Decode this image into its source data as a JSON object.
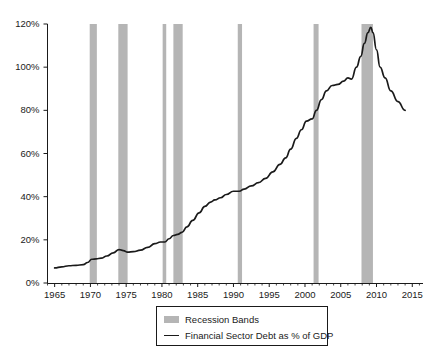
{
  "chart_data": {
    "type": "line",
    "title": "",
    "subtitle": "",
    "xlabel": "",
    "ylabel": "",
    "xlim": [
      1964,
      2016.5
    ],
    "ylim": [
      0,
      120
    ],
    "grid": false,
    "legend_position": "bottom-center",
    "x_tick_labels": [
      "1965",
      "1970",
      "1975",
      "1980",
      "1985",
      "1990",
      "1995",
      "2000",
      "2005",
      "2010",
      "2015"
    ],
    "x_tick_values": [
      1965,
      1970,
      1975,
      1980,
      1985,
      1990,
      1995,
      2000,
      2005,
      2010,
      2015
    ],
    "y_tick_labels": [
      "0%",
      "20%",
      "40%",
      "60%",
      "80%",
      "100%",
      "120%"
    ],
    "y_tick_values": [
      0,
      20,
      40,
      60,
      80,
      100,
      120
    ],
    "series": [
      {
        "name": "Financial Sector Debt as % of GDP",
        "type": "line",
        "color": "#1a1a1a",
        "x": [
          1965.0,
          1966.0,
          1967.0,
          1968.0,
          1969.0,
          1969.6,
          1970.2,
          1970.8,
          1971.5,
          1972.3,
          1973.2,
          1974.0,
          1974.6,
          1975.2,
          1976.0,
          1977.0,
          1978.0,
          1979.0,
          1979.8,
          1980.4,
          1981.0,
          1981.6,
          1982.2,
          1982.8,
          1983.5,
          1984.3,
          1985.2,
          1986.0,
          1986.8,
          1987.4,
          1988.2,
          1989.0,
          1990.0,
          1990.8,
          1991.5,
          1992.5,
          1993.5,
          1994.5,
          1995.5,
          1996.5,
          1997.3,
          1998.0,
          1998.8,
          1999.5,
          2000.2,
          2001.0,
          2001.6,
          2002.3,
          2003.0,
          2003.8,
          2004.6,
          2005.4,
          2006.0,
          2006.5,
          2007.2,
          2007.8,
          2008.3,
          2008.8,
          2009.2,
          2009.5,
          2010.0,
          2010.5,
          2011.2,
          2012.0,
          2013.0,
          2014.0
        ],
        "y": [
          7.0,
          7.5,
          8.0,
          8.2,
          8.5,
          9.5,
          11.0,
          11.2,
          11.5,
          12.5,
          14.0,
          15.5,
          15.0,
          14.3,
          14.5,
          15.2,
          16.5,
          18.2,
          19.0,
          19.0,
          20.5,
          22.0,
          22.5,
          23.5,
          26.0,
          29.0,
          32.5,
          35.5,
          37.5,
          38.5,
          39.5,
          41.0,
          42.5,
          42.5,
          43.5,
          45.0,
          46.5,
          48.5,
          51.5,
          55.0,
          58.0,
          62.0,
          67.0,
          71.0,
          75.0,
          76.0,
          80.0,
          85.0,
          89.0,
          91.5,
          92.0,
          93.5,
          95.0,
          94.5,
          100.0,
          105.0,
          111.0,
          116.0,
          118.5,
          116.0,
          108.0,
          100.0,
          95.0,
          89.0,
          84.0,
          80.0
        ],
        "units": "percent of GDP",
        "notable_points": [
          {
            "label": "start",
            "x": 1965,
            "y": 7
          },
          {
            "label": "peak",
            "x": 2009.2,
            "y": 118.5
          },
          {
            "label": "end",
            "x": 2014,
            "y": 80
          }
        ]
      }
    ],
    "recession_bands": {
      "name": "Recession Bands",
      "color": "#b5b5b5",
      "intervals": [
        {
          "start": 1969.9,
          "end": 1970.9
        },
        {
          "start": 1973.9,
          "end": 1975.2
        },
        {
          "start": 1980.1,
          "end": 1980.6
        },
        {
          "start": 1981.6,
          "end": 1982.9
        },
        {
          "start": 1990.6,
          "end": 1991.2
        },
        {
          "start": 2001.2,
          "end": 2001.9
        },
        {
          "start": 2007.9,
          "end": 2009.5
        }
      ]
    }
  },
  "legend": {
    "items": [
      {
        "label": "Recession Bands",
        "marker": "band-swatch"
      },
      {
        "label": "Financial Sector Debt as % of GDP",
        "marker": "line-swatch"
      }
    ]
  },
  "colors": {
    "axis": "#1a1a1a",
    "line": "#1a1a1a",
    "band": "#b5b5b5",
    "background": "#ffffff",
    "text": "#1a1a1a"
  }
}
